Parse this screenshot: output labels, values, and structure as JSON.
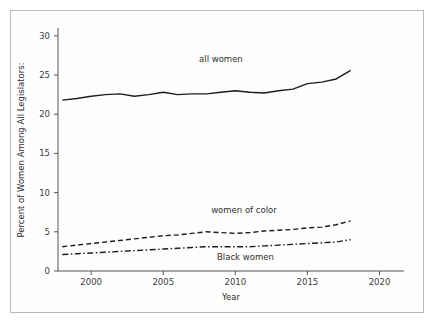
{
  "chart_data": {
    "type": "line",
    "title": "",
    "xlabel": "Year",
    "ylabel": "Percent of Women Among All Legislators:",
    "xlim": [
      1997.7,
      2021.7
    ],
    "ylim": [
      0,
      31
    ],
    "xticks": [
      "2000",
      "2005",
      "2010",
      "2015",
      "2020"
    ],
    "xtick_values": [
      2000,
      2005,
      2010,
      2015,
      2020
    ],
    "yticks": [
      "0",
      "5",
      "10",
      "15",
      "20",
      "25",
      "30"
    ],
    "ytick_values": [
      0,
      5,
      10,
      15,
      20,
      25,
      30
    ],
    "grid": false,
    "legend_position": "inline-annotations",
    "x": [
      1998,
      1999,
      2000,
      2001,
      2002,
      2003,
      2004,
      2005,
      2006,
      2007,
      2008,
      2009,
      2010,
      2011,
      2012,
      2013,
      2014,
      2015,
      2016,
      2017,
      2018
    ],
    "series": [
      {
        "name": "all women",
        "style": "solid",
        "label_x": 2009.0,
        "label_y": 26.6,
        "values": [
          21.8,
          22.0,
          22.3,
          22.5,
          22.6,
          22.3,
          22.5,
          22.8,
          22.5,
          22.6,
          22.6,
          22.8,
          23.0,
          22.8,
          22.7,
          23.0,
          23.2,
          23.9,
          24.1,
          24.5,
          25.6
        ]
      },
      {
        "name": "women of color",
        "style": "dashed",
        "label_x": 2010.6,
        "label_y": 7.4,
        "values": [
          3.1,
          3.3,
          3.5,
          3.7,
          3.9,
          4.1,
          4.3,
          4.5,
          4.6,
          4.8,
          5.0,
          4.9,
          4.8,
          4.9,
          5.1,
          5.2,
          5.3,
          5.5,
          5.6,
          5.9,
          6.4
        ]
      },
      {
        "name": "Black women",
        "style": "dashdot",
        "label_x": 2010.7,
        "label_y": 1.4,
        "values": [
          2.1,
          2.2,
          2.3,
          2.4,
          2.5,
          2.6,
          2.7,
          2.8,
          2.9,
          3.0,
          3.1,
          3.1,
          3.1,
          3.1,
          3.2,
          3.3,
          3.4,
          3.5,
          3.6,
          3.7,
          4.0
        ]
      }
    ]
  },
  "figure": {
    "border_color": "#b9b9b9",
    "line_color": "#1c1c1c",
    "background": "#ffffff"
  }
}
